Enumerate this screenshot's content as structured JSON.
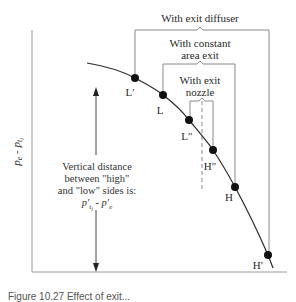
{
  "figure": {
    "y_axis_label": "p_e - p_{t_i}",
    "y_axis_label_display": {
      "main": "p",
      "sub1": "e",
      "sep": " - ",
      "main2": "p",
      "sub2": "t",
      "subsub2": "i"
    },
    "brackets": [
      {
        "id": "exit-diffuser",
        "label_lines": [
          "With exit diffuser"
        ],
        "low_point": "L′",
        "high_point": "H′"
      },
      {
        "id": "constant-area-exit",
        "label_lines": [
          "With constant",
          "area exit"
        ],
        "low_point": "L",
        "high_point": "H"
      },
      {
        "id": "exit-nozzle",
        "label_lines": [
          "With exit",
          "nozzle"
        ],
        "low_point": "L″",
        "high_point": "H″"
      }
    ],
    "points": [
      {
        "label": "L′",
        "x": 135,
        "y": 78
      },
      {
        "label": "L",
        "x": 163,
        "y": 95
      },
      {
        "label": "L″",
        "x": 189,
        "y": 120
      },
      {
        "label": "H″",
        "x": 213,
        "y": 150
      },
      {
        "label": "H",
        "x": 235,
        "y": 187
      },
      {
        "label": "H′",
        "x": 268,
        "y": 255
      }
    ],
    "note": {
      "lines": [
        "Vertical distance",
        "between \"high\"",
        "and \"low\" sides is:"
      ],
      "formula": "p′ti - p′e"
    },
    "caption": "Figure 10.27  Effect of exit..."
  },
  "colors": {
    "line": "#2b2b2b",
    "bracket": "#8a8a8a",
    "dot": "#111111",
    "axis": "#9a9a9a"
  }
}
